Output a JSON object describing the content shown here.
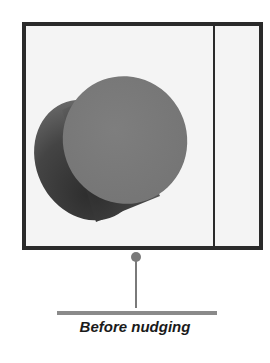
{
  "figure": {
    "caption": "Before nudging",
    "colors": {
      "frame_border": "#2a2a2a",
      "frame_background": "#f4f4f4",
      "cylinder_face": "#7a7a7a",
      "cylinder_body_dark": "#3a3a3a",
      "pin": "#7a7a7a",
      "baseline": "#8a8a8a"
    },
    "shape": "cylinder"
  }
}
